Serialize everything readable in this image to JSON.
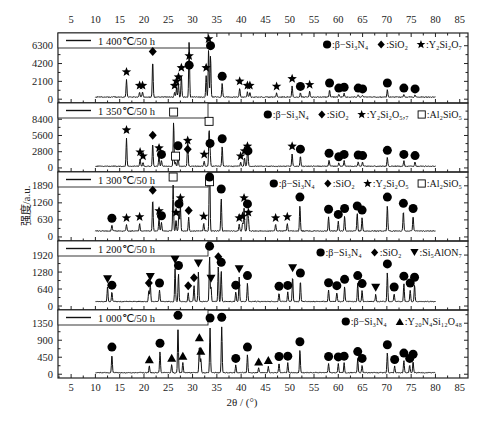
{
  "chart_data": {
    "type": "line",
    "title": "",
    "xlabel": "2θ / (°)",
    "ylabel": "强度/a.u.",
    "xlim": [
      2.3,
      86.7
    ],
    "x_ticks": [
      5,
      10,
      15,
      20,
      25,
      30,
      35,
      40,
      45,
      50,
      55,
      60,
      65,
      70,
      75,
      80,
      85
    ],
    "data_range": [
      10,
      80
    ],
    "grid": false,
    "legend_position": "top-right of each panel",
    "panels": [
      {
        "condition": "1 400℃/50 h",
        "y_ticks": [
          0,
          2100,
          4200,
          6300
        ],
        "ylim": [
          -450,
          7800
        ],
        "baseline": 250,
        "legend": [
          {
            "marker": "circle",
            "label": ":β−Si₃N₄"
          },
          {
            "marker": "diamond",
            "label": ":SiO₂"
          },
          {
            "marker": "star",
            "label": ":Y₂Si₂O₇"
          }
        ],
        "peaks": [
          {
            "x": 16.4,
            "y": 2500,
            "marker": "star"
          },
          {
            "x": 19.1,
            "y": 900,
            "marker": "star"
          },
          {
            "x": 19.7,
            "y": 900,
            "marker": "star"
          },
          {
            "x": 21.8,
            "y": 4900,
            "marker": "diamond"
          },
          {
            "x": 26.3,
            "y": 900,
            "marker": "star"
          },
          {
            "x": 26.7,
            "y": 1400,
            "marker": "star"
          },
          {
            "x": 27.1,
            "y": 1900,
            "marker": "star"
          },
          {
            "x": 27.7,
            "y": 3000,
            "marker": "star"
          },
          {
            "x": 29.3,
            "y": 3300,
            "marker": "circle"
          },
          {
            "x": 29.3,
            "y": 4400,
            "marker": "star"
          },
          {
            "x": 32.8,
            "y": 3000,
            "marker": "star"
          },
          {
            "x": 33.3,
            "y": 6400,
            "marker": "star"
          },
          {
            "x": 33.7,
            "y": 5600,
            "marker": "circle"
          },
          {
            "x": 36.1,
            "y": 2000,
            "marker": "circle"
          },
          {
            "x": 39.7,
            "y": 1400,
            "marker": "star"
          },
          {
            "x": 41.3,
            "y": 900,
            "marker": "star"
          },
          {
            "x": 41.8,
            "y": 900,
            "marker": "star"
          },
          {
            "x": 47.3,
            "y": 800,
            "marker": "star"
          },
          {
            "x": 50.5,
            "y": 1700,
            "marker": "star"
          },
          {
            "x": 52.2,
            "y": 800,
            "marker": "circle"
          },
          {
            "x": 54.1,
            "y": 1000,
            "marker": "star"
          },
          {
            "x": 58.2,
            "y": 1200,
            "marker": "circle"
          },
          {
            "x": 60.1,
            "y": 600,
            "marker": "circle"
          },
          {
            "x": 61.2,
            "y": 700,
            "marker": "circle"
          },
          {
            "x": 64.1,
            "y": 600,
            "marker": "circle"
          },
          {
            "x": 65.0,
            "y": 500,
            "marker": "circle"
          },
          {
            "x": 70.1,
            "y": 1200,
            "marker": "circle"
          },
          {
            "x": 73.5,
            "y": 600,
            "marker": "circle"
          },
          {
            "x": 75.8,
            "y": 500,
            "marker": "circle"
          }
        ]
      },
      {
        "condition": "1 350℃/50 h",
        "y_ticks": [
          0,
          2800,
          5600,
          8400
        ],
        "ylim": [
          -700,
          11200
        ],
        "baseline": 300,
        "legend": [
          {
            "marker": "circle",
            "label": ":β−Si₃N₄"
          },
          {
            "marker": "diamond",
            "label": ":SiO₂"
          },
          {
            "marker": "star",
            "label": ":Y₂Si₂O₅,₇"
          },
          {
            "marker": "square",
            "label": ":Al₂SiO₅"
          }
        ],
        "peaks": [
          {
            "x": 16.4,
            "y": 5500,
            "marker": "star"
          },
          {
            "x": 19.2,
            "y": 1700,
            "marker": "star"
          },
          {
            "x": 19.8,
            "y": 1000,
            "marker": "star"
          },
          {
            "x": 21.8,
            "y": 4600,
            "marker": "diamond"
          },
          {
            "x": 23.1,
            "y": 2400,
            "marker": "star"
          },
          {
            "x": 23.6,
            "y": 1300,
            "marker": "circle"
          },
          {
            "x": 26.1,
            "y": 8600,
            "marker": "square"
          },
          {
            "x": 26.5,
            "y": 1000,
            "marker": "square"
          },
          {
            "x": 27.0,
            "y": 2800,
            "marker": "circle"
          },
          {
            "x": 29.0,
            "y": 3700,
            "marker": "star"
          },
          {
            "x": 29.0,
            "y": 2200,
            "marker": "diamond"
          },
          {
            "x": 32.4,
            "y": 1300,
            "marker": "star"
          },
          {
            "x": 33.4,
            "y": 7000,
            "marker": "square"
          },
          {
            "x": 33.6,
            "y": 3200,
            "marker": "circle"
          },
          {
            "x": 36.1,
            "y": 4000,
            "marker": "circle"
          },
          {
            "x": 39.9,
            "y": 1000,
            "marker": "star"
          },
          {
            "x": 40.7,
            "y": 1900,
            "marker": "star"
          },
          {
            "x": 41.3,
            "y": 2700,
            "marker": "star"
          },
          {
            "x": 41.4,
            "y": 1900,
            "marker": "circle"
          },
          {
            "x": 50.5,
            "y": 2700,
            "marker": "star"
          },
          {
            "x": 52.2,
            "y": 2200,
            "marker": "circle"
          },
          {
            "x": 58.1,
            "y": 1500,
            "marker": "circle"
          },
          {
            "x": 60.1,
            "y": 900,
            "marker": "circle"
          },
          {
            "x": 61.2,
            "y": 1300,
            "marker": "circle"
          },
          {
            "x": 64.1,
            "y": 1200,
            "marker": "circle"
          },
          {
            "x": 65.0,
            "y": 1100,
            "marker": "circle"
          },
          {
            "x": 70.1,
            "y": 2000,
            "marker": "circle"
          },
          {
            "x": 73.5,
            "y": 1300,
            "marker": "circle"
          },
          {
            "x": 75.8,
            "y": 1100,
            "marker": "circle"
          }
        ]
      },
      {
        "condition": "1 300℃/50 h",
        "y_ticks": [
          0,
          630,
          1260,
          1890
        ],
        "ylim": [
          -150,
          2400
        ],
        "baseline": 220,
        "legend": [
          {
            "marker": "circle",
            "label": ":β−Si₃N₄"
          },
          {
            "marker": "diamond",
            "label": ":SiO₂"
          },
          {
            "marker": "star",
            "label": ":Y₂Si₂O₅"
          },
          {
            "marker": "square",
            "label": ":Al₂SiO₅"
          }
        ],
        "peaks": [
          {
            "x": 13.4,
            "y": 470,
            "marker": "circle"
          },
          {
            "x": 16.4,
            "y": 480,
            "marker": "star"
          },
          {
            "x": 19.1,
            "y": 520,
            "marker": "star"
          },
          {
            "x": 21.8,
            "y": 1500,
            "marker": "diamond"
          },
          {
            "x": 23.1,
            "y": 740,
            "marker": "star"
          },
          {
            "x": 23.6,
            "y": 560,
            "marker": "circle"
          },
          {
            "x": 26.0,
            "y": 2080,
            "marker": "square"
          },
          {
            "x": 26.6,
            "y": 680,
            "marker": "star"
          },
          {
            "x": 27.2,
            "y": 1000,
            "marker": "circle"
          },
          {
            "x": 27.5,
            "y": 1220,
            "marker": "star"
          },
          {
            "x": 29.2,
            "y": 760,
            "marker": "diamond"
          },
          {
            "x": 32.3,
            "y": 540,
            "marker": "star"
          },
          {
            "x": 33.5,
            "y": 1820,
            "marker": "square"
          },
          {
            "x": 33.5,
            "y": 2050,
            "marker": "circle"
          },
          {
            "x": 35.9,
            "y": 1550,
            "marker": "circle"
          },
          {
            "x": 39.6,
            "y": 480,
            "marker": "star"
          },
          {
            "x": 40.3,
            "y": 540,
            "marker": "star"
          },
          {
            "x": 40.6,
            "y": 1220,
            "marker": "star"
          },
          {
            "x": 41.3,
            "y": 1000,
            "marker": "circle"
          },
          {
            "x": 41.5,
            "y": 680,
            "marker": "star"
          },
          {
            "x": 47.1,
            "y": 480,
            "marker": "star"
          },
          {
            "x": 49.5,
            "y": 520,
            "marker": "star"
          },
          {
            "x": 52.1,
            "y": 1250,
            "marker": "circle"
          },
          {
            "x": 58.0,
            "y": 800,
            "marker": "circle"
          },
          {
            "x": 60.0,
            "y": 610,
            "marker": "circle"
          },
          {
            "x": 61.3,
            "y": 830,
            "marker": "circle"
          },
          {
            "x": 63.9,
            "y": 920,
            "marker": "circle"
          },
          {
            "x": 64.9,
            "y": 770,
            "marker": "circle"
          },
          {
            "x": 70.1,
            "y": 1250,
            "marker": "circle"
          },
          {
            "x": 73.4,
            "y": 1020,
            "marker": "circle"
          },
          {
            "x": 75.4,
            "y": 830,
            "marker": "circle"
          }
        ]
      },
      {
        "condition": "1 200℃/50 h",
        "y_ticks": [
          0,
          640,
          1280,
          1920
        ],
        "ylim": [
          -150,
          2450
        ],
        "baseline": 170,
        "legend": [
          {
            "marker": "circle",
            "label": ":β−Si₃N₄"
          },
          {
            "marker": "diamond",
            "label": ":SiO₂"
          },
          {
            "marker": "triangle-down",
            "label": ":Si₅AlON₇"
          }
        ],
        "peaks": [
          {
            "x": 12.5,
            "y": 780,
            "marker": "triangle-down"
          },
          {
            "x": 13.4,
            "y": 560,
            "marker": "circle"
          },
          {
            "x": 21.0,
            "y": 640,
            "marker": "diamond"
          },
          {
            "x": 21.3,
            "y": 870,
            "marker": "triangle-down"
          },
          {
            "x": 23.2,
            "y": 640,
            "marker": "circle"
          },
          {
            "x": 26.4,
            "y": 1520,
            "marker": "triangle-down"
          },
          {
            "x": 27.1,
            "y": 1300,
            "marker": "circle"
          },
          {
            "x": 29.1,
            "y": 540,
            "marker": "diamond"
          },
          {
            "x": 30.3,
            "y": 840,
            "marker": "diamond"
          },
          {
            "x": 31.2,
            "y": 1380,
            "marker": "triangle-down"
          },
          {
            "x": 33.5,
            "y": 2030,
            "marker": "circle"
          },
          {
            "x": 33.8,
            "y": 800,
            "marker": "triangle-down"
          },
          {
            "x": 35.3,
            "y": 1630,
            "marker": "diamond"
          },
          {
            "x": 35.9,
            "y": 1420,
            "marker": "circle"
          },
          {
            "x": 38.9,
            "y": 560,
            "marker": "circle"
          },
          {
            "x": 39.6,
            "y": 1160,
            "marker": "triangle-down"
          },
          {
            "x": 41.3,
            "y": 920,
            "marker": "circle"
          },
          {
            "x": 47.8,
            "y": 520,
            "marker": "circle"
          },
          {
            "x": 49.6,
            "y": 550,
            "marker": "circle"
          },
          {
            "x": 50.6,
            "y": 1200,
            "marker": "triangle-down"
          },
          {
            "x": 52.2,
            "y": 1020,
            "marker": "circle"
          },
          {
            "x": 58.0,
            "y": 650,
            "marker": "circle"
          },
          {
            "x": 59.7,
            "y": 540,
            "marker": "circle"
          },
          {
            "x": 61.3,
            "y": 780,
            "marker": "circle"
          },
          {
            "x": 64.0,
            "y": 920,
            "marker": "circle"
          },
          {
            "x": 64.9,
            "y": 620,
            "marker": "circle"
          },
          {
            "x": 67.7,
            "y": 460,
            "marker": "triangle-down"
          },
          {
            "x": 70.1,
            "y": 1360,
            "marker": "circle"
          },
          {
            "x": 71.5,
            "y": 490,
            "marker": "circle"
          },
          {
            "x": 73.5,
            "y": 900,
            "marker": "circle"
          },
          {
            "x": 74.8,
            "y": 640,
            "marker": "circle"
          },
          {
            "x": 75.7,
            "y": 860,
            "marker": "circle"
          }
        ]
      },
      {
        "condition": "1 000℃/50 h",
        "y_ticks": [
          0,
          450,
          900,
          1350
        ],
        "ylim": [
          -100,
          1700
        ],
        "baseline": 40,
        "legend": [
          {
            "marker": "circle",
            "label": ":β−Si₃N₄"
          },
          {
            "marker": "triangle-up",
            "label": ":Y₂₀N₄Si₁₂O₄₈"
          }
        ],
        "peaks": [
          {
            "x": 13.4,
            "y": 560,
            "marker": "circle"
          },
          {
            "x": 21.1,
            "y": 240,
            "marker": "triangle-up"
          },
          {
            "x": 23.3,
            "y": 660,
            "marker": "circle"
          },
          {
            "x": 25.7,
            "y": 280,
            "marker": "triangle-up"
          },
          {
            "x": 27.0,
            "y": 1400,
            "marker": "circle"
          },
          {
            "x": 28.0,
            "y": 330,
            "marker": "triangle-up"
          },
          {
            "x": 31.4,
            "y": 820,
            "marker": "triangle-up"
          },
          {
            "x": 31.7,
            "y": 460,
            "marker": "triangle-up"
          },
          {
            "x": 33.6,
            "y": 1330,
            "marker": "circle"
          },
          {
            "x": 36.0,
            "y": 1350,
            "marker": "circle"
          },
          {
            "x": 38.9,
            "y": 260,
            "marker": "circle"
          },
          {
            "x": 41.3,
            "y": 560,
            "marker": "circle"
          },
          {
            "x": 43.6,
            "y": 180,
            "marker": "triangle-up"
          },
          {
            "x": 45.6,
            "y": 220,
            "marker": "triangle-up"
          },
          {
            "x": 47.8,
            "y": 310,
            "marker": "circle"
          },
          {
            "x": 49.6,
            "y": 320,
            "marker": "circle"
          },
          {
            "x": 52.1,
            "y": 700,
            "marker": "circle"
          },
          {
            "x": 58.0,
            "y": 310,
            "marker": "circle"
          },
          {
            "x": 60.0,
            "y": 300,
            "marker": "circle"
          },
          {
            "x": 61.2,
            "y": 320,
            "marker": "circle"
          },
          {
            "x": 64.0,
            "y": 440,
            "marker": "circle"
          },
          {
            "x": 64.9,
            "y": 260,
            "marker": "circle"
          },
          {
            "x": 70.1,
            "y": 620,
            "marker": "circle"
          },
          {
            "x": 71.6,
            "y": 230,
            "marker": "circle"
          },
          {
            "x": 73.5,
            "y": 400,
            "marker": "circle"
          },
          {
            "x": 74.7,
            "y": 260,
            "marker": "circle"
          },
          {
            "x": 75.4,
            "y": 370,
            "marker": "circle"
          }
        ]
      }
    ]
  }
}
